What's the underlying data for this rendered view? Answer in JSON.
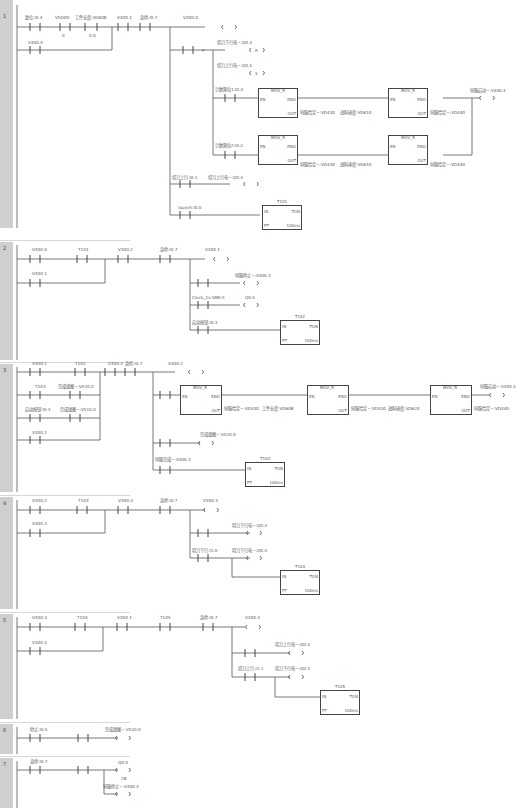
{
  "networks": [
    {
      "number": "1",
      "contacts": [
        "复位:I0.4",
        "V5D00",
        "工件长度:VD608",
        "V300.1",
        "急停:I0.7",
        "V300.0"
      ],
      "parallel": [
        "V300.0"
      ],
      "compare_ops": [
        "==R",
        "==R"
      ],
      "compare_vals": [
        "0",
        "0.0"
      ],
      "coils": [
        {
          "label": "切刀下行电~:Q0.3",
          "type": "R",
          "n": "1"
        },
        {
          "label": "切刀上行电~:Q0.4",
          "type": "S",
          "n": "1"
        },
        {
          "label": "伺服启动~:V400.4",
          "type": "S",
          "n": "1"
        },
        {
          "label": "切刀上行电~:Q0.4",
          "type": "R",
          "n": "1"
        }
      ],
      "branch_contacts": [
        "计数限位1:I0.3",
        "计数限位2:I0.2",
        "切刀上行:I0.1",
        "launch:I0.0"
      ],
      "blocks": [
        {
          "name": "MOV_R",
          "in": "0",
          "out": "伺服给定~:VD430",
          "in2": "进料速度:VD610",
          "out2": "伺服给定~:VD440"
        },
        {
          "name": "MOV_R",
          "in": "0",
          "out": "伺服给定~:VD430",
          "in2": "进料速度:VD610",
          "out2": "伺服给定~:VD440"
        }
      ],
      "timer": {
        "name": "T101",
        "type": "TON",
        "pt": "5",
        "base": "100ms"
      }
    },
    {
      "number": "2",
      "contacts": [
        "V300.0",
        "T101",
        "V300.2",
        "急停:I0.7",
        "V300.1"
      ],
      "parallel": [
        "V300.1"
      ],
      "coils": [
        {
          "label": "伺服停止~:V400.3",
          "type": "S",
          "n": "1"
        },
        {
          "label": "Q0.5",
          "type": "",
          "n": ""
        }
      ],
      "branch_contacts": [
        "Clock_1s:SM0.5",
        "启动按钮:I0.3"
      ],
      "timer": {
        "name": "T102",
        "type": "TON",
        "pt": "5",
        "base": "100ms"
      }
    },
    {
      "number": "3",
      "contacts": [
        "V300.1",
        "T102",
        "V300.3",
        "急停:I0.7",
        "V300.2"
      ],
      "parallel": [
        "T103",
        "完成填图~:V510.0",
        "启动按钮:I0.3",
        "完成填图~:V510.0",
        "V300.2"
      ],
      "blocks": [
        {
          "name": "MOV_R",
          "in": "0",
          "out": "伺服给定~:VD430",
          "label": "工件长度:VD608"
        },
        {
          "name": "MOV_R",
          "in": "",
          "out": "伺服给定~:VD430",
          "label": "进料速度:VD620"
        },
        {
          "name": "MOV_R",
          "in": "",
          "out": "伺服给定~:VD440",
          "label": ""
        }
      ],
      "coils": [
        {
          "label": "伺服启动~:V400.4",
          "type": "S",
          "n": "1"
        },
        {
          "label": "完成填图~:V510.0",
          "type": "R",
          "n": "1"
        }
      ],
      "branch_contacts": [
        "伺服完成~:V400.3"
      ],
      "timer": {
        "name": "T103",
        "type": "TON",
        "pt": "5",
        "base": "100ms"
      }
    },
    {
      "number": "4",
      "contacts": [
        "V300.2",
        "T103",
        "V300.4",
        "急停:I0.7",
        "V300.3"
      ],
      "parallel": [
        "V300.3"
      ],
      "coils": [
        {
          "label": "切刀下行电~:Q0.3",
          "type": "S",
          "n": "1"
        },
        {
          "label": "切刀下行电~:Q0.3",
          "type": "R",
          "n": "1"
        }
      ],
      "branch_contacts": [
        "切刀下行:I1.0"
      ],
      "timer": {
        "name": "T104",
        "type": "TON",
        "pt": "5",
        "base": "100ms"
      }
    },
    {
      "number": "5",
      "contacts": [
        "V300.3",
        "T104",
        "V300.1",
        "T105",
        "急停:I0.7",
        "V300.4"
      ],
      "parallel": [
        "V300.4"
      ],
      "coils": [
        {
          "label": "切刀上行电~:Q0.4",
          "type": "S",
          "n": "1"
        },
        {
          "label": "切刀下行电~:Q0.3",
          "type": "R",
          "n": "1"
        }
      ],
      "branch_contacts": [
        "切刀上行:I1.1"
      ],
      "timer": {
        "name": "T105",
        "type": "TON",
        "pt": "5",
        "base": "100ms"
      }
    },
    {
      "number": "6",
      "contacts": [
        "停止:I0.5"
      ],
      "coils": [
        {
          "label": "完成填图~:V510.0",
          "type": "S",
          "n": "1"
        }
      ]
    },
    {
      "number": "7",
      "contacts": [
        "急停:I0.7"
      ],
      "coils": [
        {
          "label": "Q0.0",
          "type": "R",
          "n": "28"
        },
        {
          "label": "伺服停止~:V400.3",
          "type": "S",
          "n": "1"
        }
      ]
    }
  ],
  "symbols": {
    "p_edge": "P",
    "neg": "/",
    "en": "EN",
    "eno": "ENO",
    "in": "IN",
    "out": "OUT",
    "pt": "PT"
  }
}
